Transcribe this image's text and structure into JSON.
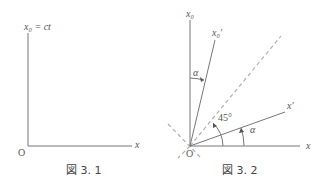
{
  "figure1": {
    "caption": "図 3. 1",
    "y_axis_label": "x₀ = ct",
    "x_axis_label": "x",
    "origin_label": "O"
  },
  "figure2": {
    "caption": "図 3. 2",
    "x0_label": "x₀",
    "x0_prime_label": "x₀′",
    "x_label": "x",
    "x_prime_label": "x′",
    "origin_label": "O",
    "angle_alpha_upper": "α",
    "angle_alpha_lower": "α",
    "angle_45": "45°"
  },
  "colors": {
    "axis": "#777777",
    "dashed": "#aaaaaa",
    "text": "#555555"
  }
}
